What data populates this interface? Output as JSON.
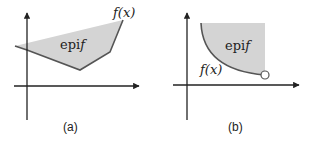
{
  "panels": [
    {
      "id": "a",
      "caption": "(a)",
      "region_label_prefix": "epi",
      "region_label_var": "f",
      "curve_label": "f(x)",
      "fill_color": "#d4d4d4",
      "stroke_color": "#555555"
    },
    {
      "id": "b",
      "caption": "(b)",
      "region_label_prefix": "epi",
      "region_label_var": "f",
      "curve_label": "f(x)",
      "fill_color": "#d4d4d4",
      "stroke_color": "#555555",
      "open_endpoint": true
    }
  ]
}
